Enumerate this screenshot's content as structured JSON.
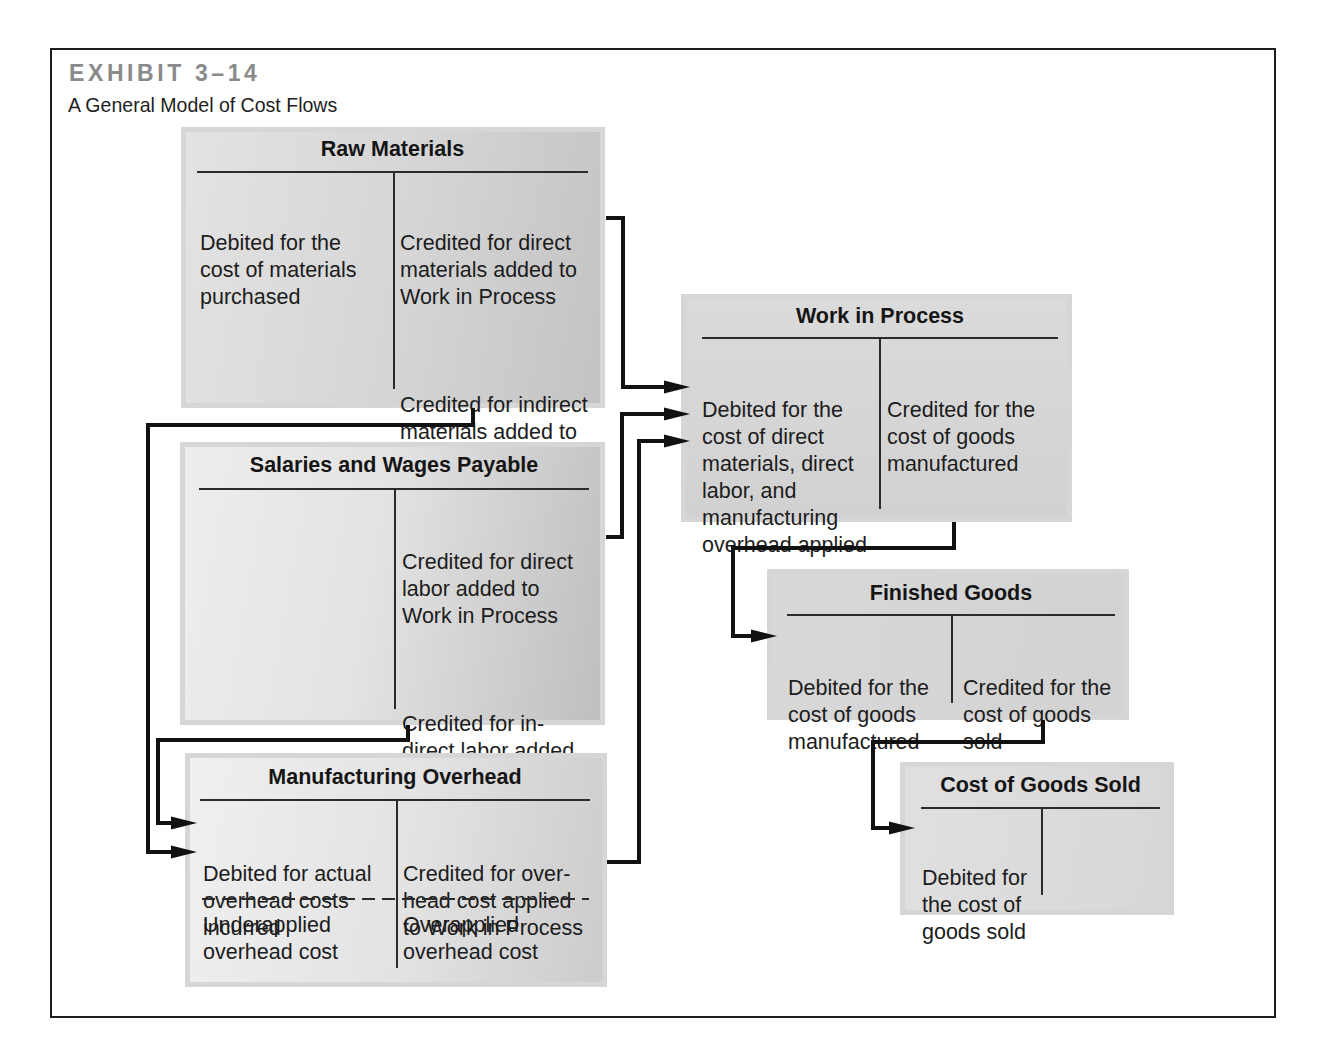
{
  "exhibit": {
    "label": "EXHIBIT 3–14",
    "title": "A General Model of Cost Flows"
  },
  "accounts": {
    "raw_materials": {
      "title": "Raw Materials",
      "debit": [
        "Debited for the\ncost of materials\npurchased"
      ],
      "credit": [
        "Credited for direct\nmaterials added to\nWork in Process",
        "Credited for indirect\nmaterials added to\nManufacturing\nOverhead"
      ]
    },
    "salaries_and_wages_payable": {
      "title": "Salaries and Wages Payable",
      "debit": [],
      "credit": [
        "Credited for direct\nlabor added to\nWork in Process",
        "Credited for in-\ndirect labor added\nto Manufacturing\nOverhead"
      ]
    },
    "manufacturing_overhead": {
      "title": "Manufacturing Overhead",
      "debit": [
        "Debited for actual\noverhead costs\nincurred"
      ],
      "credit": [
        "Credited for over-\nhead cost applied\nto Work in Process"
      ],
      "balance_debit": "Underapplied\noverhead cost",
      "balance_credit": "Overapplied\noverhead cost"
    },
    "work_in_process": {
      "title": "Work in Process",
      "debit": [
        "Debited for the\ncost of direct\nmaterials, direct\nlabor, and\nmanufacturing\noverhead applied"
      ],
      "credit": [
        "Credited for the\ncost of goods\nmanufactured"
      ]
    },
    "finished_goods": {
      "title": "Finished Goods",
      "debit": [
        "Debited for the\ncost of goods\nmanufactured"
      ],
      "credit": [
        "Credited for the\ncost of goods\nsold"
      ]
    },
    "cost_of_goods_sold": {
      "title": "Cost of Goods Sold",
      "debit": [
        "Debited for\nthe cost of\ngoods sold"
      ],
      "credit": []
    }
  },
  "flows": [
    {
      "from": "Raw Materials (direct materials)",
      "to": "Work in Process"
    },
    {
      "from": "Salaries and Wages Payable (direct labor)",
      "to": "Work in Process"
    },
    {
      "from": "Manufacturing Overhead (applied)",
      "to": "Work in Process"
    },
    {
      "from": "Raw Materials (indirect materials)",
      "to": "Manufacturing Overhead"
    },
    {
      "from": "Salaries and Wages Payable (indirect labor)",
      "to": "Manufacturing Overhead"
    },
    {
      "from": "Work in Process",
      "to": "Finished Goods"
    },
    {
      "from": "Finished Goods",
      "to": "Cost of Goods Sold"
    }
  ]
}
